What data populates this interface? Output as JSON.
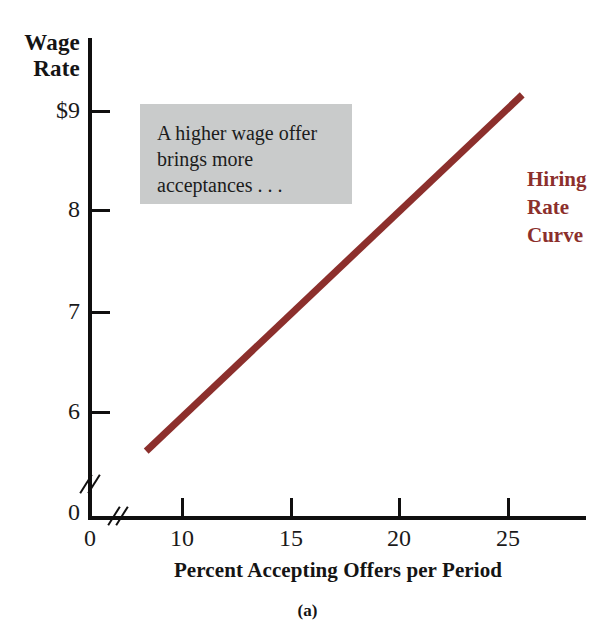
{
  "figure": {
    "panel_caption": "(a)",
    "x_axis_title": "Percent Accepting Offers per Period",
    "y_axis_title_line1": "Wage",
    "y_axis_title_line2": "Rate",
    "curve_label_line1": "Hiring",
    "curve_label_line2": "Rate",
    "curve_label_line3": "Curve",
    "annotation_line1": "A higher wage offer",
    "annotation_line2": "brings more",
    "annotation_line3": "acceptances . . ."
  },
  "colors": {
    "curve": "#8c2f2c",
    "annotation_background": "#c9cbcb",
    "axis": "#100f0f",
    "text": "#1a1a1a"
  },
  "chart_data": {
    "type": "line",
    "title": "",
    "subtitle": "",
    "xlabel": "Percent Accepting Offers per Period",
    "ylabel": "Wage Rate",
    "xlim": [
      0,
      27
    ],
    "ylim": [
      0,
      9.3
    ],
    "x_origin_label": "0",
    "y_origin_label": "0",
    "xticks": [
      10,
      15,
      20,
      25
    ],
    "xticklabels": [
      "10",
      "15",
      "20",
      "25"
    ],
    "yticks": [
      6,
      7,
      8,
      9
    ],
    "yticklabels": [
      "6",
      "7",
      "8",
      "9"
    ],
    "y_tick_prefix_label": "$9",
    "axis_break_x": true,
    "axis_break_y": true,
    "grid": false,
    "legend": "none",
    "series": [
      {
        "name": "Hiring Rate Curve",
        "color": "#8c2f2c",
        "x": [
          8.4,
          25.7
        ],
        "y": [
          5.6,
          9.15
        ]
      }
    ],
    "annotations": [
      {
        "text": "A higher wage offer brings more acceptances . . .",
        "x": 12.0,
        "y": 8.6,
        "style": "gray-box"
      },
      {
        "text": "Hiring Rate Curve",
        "x": 26.5,
        "y": 8.2,
        "style": "curve-label"
      }
    ]
  }
}
